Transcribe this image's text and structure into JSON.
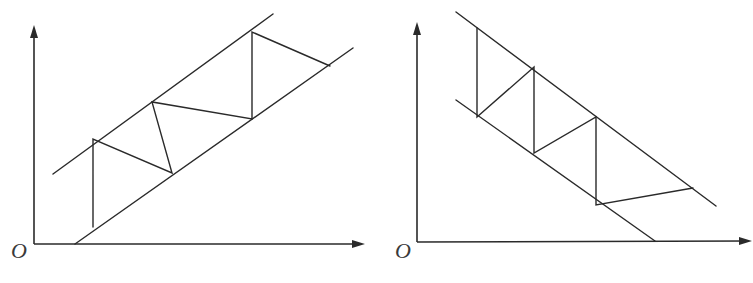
{
  "colors": {
    "stroke": "#2a2a2a",
    "label": "#3a3a3a",
    "background": "#ffffff"
  },
  "diagrams": [
    {
      "name": "rising-channel",
      "origin_label": "O",
      "origin_label_pos": [
        11,
        258
      ],
      "x_axis": [
        [
          34,
          244
        ],
        [
          360,
          244
        ]
      ],
      "x_arrow": [
        [
          365,
          244
        ],
        [
          352,
          240
        ],
        [
          352,
          248
        ]
      ],
      "y_axis": [
        [
          34,
          244
        ],
        [
          34,
          32
        ]
      ],
      "y_arrow": [
        [
          34,
          25
        ],
        [
          30,
          38
        ],
        [
          38,
          38
        ]
      ],
      "upper_line": [
        [
          53,
          174
        ],
        [
          273,
          14
        ]
      ],
      "lower_line": [
        [
          75,
          244
        ],
        [
          353,
          48
        ]
      ],
      "zigzag": [
        [
          93,
          227
        ],
        [
          93,
          139
        ],
        [
          172,
          173
        ],
        [
          152,
          102
        ],
        [
          252,
          119
        ],
        [
          252,
          32
        ],
        [
          330,
          66
        ]
      ]
    },
    {
      "name": "falling-channel",
      "origin_label": "O",
      "origin_label_pos": [
        395,
        258
      ],
      "x_axis": [
        [
          417,
          242
        ],
        [
          746,
          241
        ]
      ],
      "x_arrow": [
        [
          752,
          241
        ],
        [
          739,
          237
        ],
        [
          739,
          245
        ]
      ],
      "y_axis": [
        [
          417,
          242
        ],
        [
          417,
          30
        ]
      ],
      "y_arrow": [
        [
          417,
          22
        ],
        [
          413,
          35
        ],
        [
          421,
          35
        ]
      ],
      "upper_line": [
        [
          456,
          12
        ],
        [
          716,
          206
        ]
      ],
      "lower_line": [
        [
          456,
          100
        ],
        [
          655,
          241
        ]
      ],
      "zigzag": [
        [
          477,
          28
        ],
        [
          477,
          117
        ],
        [
          534,
          67
        ],
        [
          534,
          153
        ],
        [
          596,
          117
        ],
        [
          596,
          205
        ],
        [
          693,
          188
        ]
      ]
    }
  ]
}
